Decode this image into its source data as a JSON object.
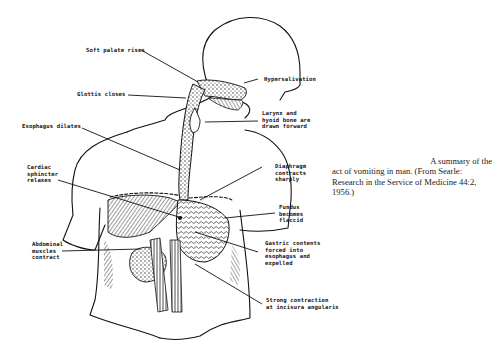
{
  "figure": {
    "labels": {
      "soft_palate": "Soft palate rises",
      "hypersalivation": "Hypersalivation",
      "glottis": "Glottis closes",
      "larynx": "Larynx and\nhyoid bone are\ndrawn forward",
      "esophagus": "Esophagus dilates",
      "diaphragm": "Diaphragm\ncontracts\nsharply",
      "cardiac": "Cardiac\nsphincter\nrelaxes",
      "fundus": "Fundus\nbecomes\nflaccid",
      "abdominal": "Abdominal\nmuscles\ncontract",
      "gastric": "Gastric contents\nforced into\nesophagus and\nexpelled",
      "incisura": "Strong contraction\nat incisura angularis"
    }
  },
  "caption": {
    "line1": "A summary of the",
    "rest": "act of vomiting in man. (From Searle: Research in the Service of Medicine 44:2, 1956.)"
  }
}
